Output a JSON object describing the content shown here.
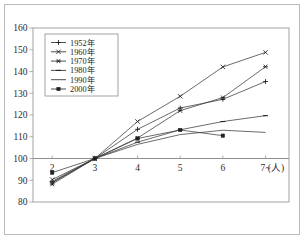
{
  "chart_data": {
    "type": "line",
    "title": "",
    "subtitle": "",
    "xlabel": "(人)",
    "ylabel": "",
    "x": [
      "2",
      "3",
      "4",
      "5",
      "6",
      "7~"
    ],
    "categories": [
      "2",
      "3",
      "4",
      "5",
      "6",
      "7~"
    ],
    "xlim": [
      1.55,
      7.55
    ],
    "ylim": [
      80,
      160
    ],
    "yticks": [
      80,
      90,
      100,
      110,
      120,
      130,
      140,
      150,
      160
    ],
    "ytick_labels": [
      "80",
      "90",
      "100",
      "110",
      "120",
      "130",
      "140",
      "150",
      "160"
    ],
    "xtick_labels": [
      "2",
      "3",
      "4",
      "5",
      "6",
      "7~"
    ],
    "grid": false,
    "baseline_value": 100,
    "legend_position": "top-left",
    "series": [
      {
        "name": "1952年",
        "marker": "plus",
        "values": [
          88.8,
          100,
          113.4,
          123.2,
          127.2,
          135.4
        ]
      },
      {
        "name": "1960年",
        "marker": "cross",
        "values": [
          90.3,
          100,
          117.0,
          128.6,
          142.1,
          148.8
        ]
      },
      {
        "name": "1970年",
        "marker": "star",
        "values": [
          88.2,
          100,
          109.4,
          122.0,
          128.0,
          142.2
        ]
      },
      {
        "name": "1980年",
        "marker": "dash",
        "values": [
          89.5,
          100,
          107.5,
          113.2,
          117.0,
          119.7
        ]
      },
      {
        "name": "1990年",
        "marker": "none",
        "values": [
          89.0,
          100,
          106.5,
          111.0,
          113.0,
          112.0
        ]
      },
      {
        "name": "2000年",
        "marker": "square",
        "values": [
          93.5,
          100,
          109.2,
          113.1,
          110.5,
          null
        ]
      }
    ]
  },
  "legend": {
    "entries": [
      {
        "label": "1952年"
      },
      {
        "label": "1960年"
      },
      {
        "label": "1970年"
      },
      {
        "label": "1980年"
      },
      {
        "label": "1990年"
      },
      {
        "label": "2000年"
      }
    ]
  },
  "axes": {
    "y_labels": [
      "160",
      "150",
      "140",
      "130",
      "120",
      "110",
      "100",
      "90",
      "80"
    ],
    "x_labels": [
      "2",
      "3",
      "4",
      "5",
      "6",
      "7~"
    ],
    "x_unit": "(人)"
  },
  "colors": {
    "line": "#3a3a3a",
    "axis": "#9a9a9a",
    "text": "#2b2b2b",
    "background": "#ffffff",
    "frame": "#b9b9b9"
  }
}
